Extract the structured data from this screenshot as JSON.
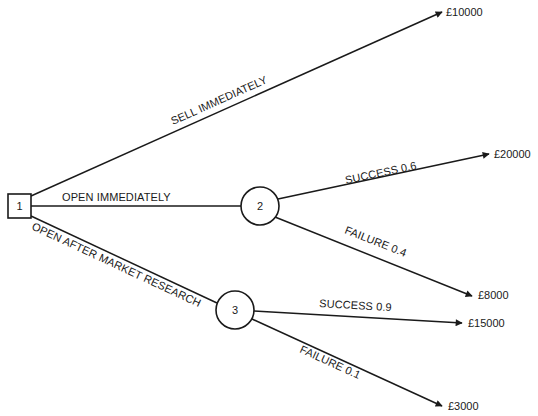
{
  "diagram": {
    "type": "decision-tree",
    "nodes": {
      "decision": {
        "label": "1",
        "shape": "square"
      },
      "chance_open": {
        "label": "2",
        "shape": "circle"
      },
      "chance_research": {
        "label": "3",
        "shape": "circle"
      }
    },
    "branches": {
      "sell": {
        "label": "SELL IMMEDIATELY",
        "outcome": "£10000"
      },
      "open": {
        "label": "OPEN IMMEDIATELY"
      },
      "research": {
        "label": "OPEN AFTER MARKET RESEARCH"
      },
      "open_success": {
        "label": "SUCCESS 0.6",
        "outcome": "£20000"
      },
      "open_failure": {
        "label": "FAILURE 0.4",
        "outcome": "£8000"
      },
      "research_success": {
        "label": "SUCCESS 0.9",
        "outcome": "£15000"
      },
      "research_failure": {
        "label": "FAILURE 0.1",
        "outcome": "£3000"
      }
    },
    "colors": {
      "line": "#1a1a1a",
      "background": "#ffffff"
    }
  }
}
